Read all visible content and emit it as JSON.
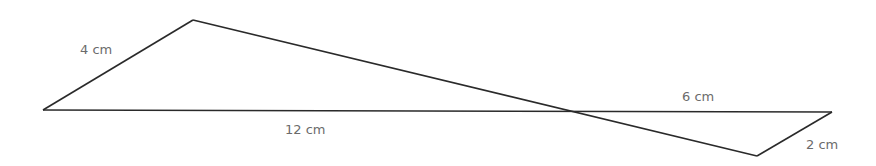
{
  "diagram": {
    "vertices": {
      "left": [
        43,
        110
      ],
      "top": [
        193,
        20
      ],
      "intersection": [
        570,
        111
      ],
      "right": [
        832,
        112
      ],
      "bottom": [
        757,
        156
      ]
    },
    "labels": {
      "top_left_side": "4 cm",
      "long_base": "12 cm",
      "short_base": "6 cm",
      "bottom_right_side": "2 cm"
    },
    "colors": {
      "line": "#2a2a2a",
      "label": "#6b6b6b"
    }
  }
}
